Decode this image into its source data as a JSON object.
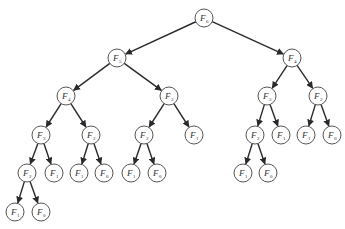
{
  "diagram": {
    "node_radius": 9,
    "colors": {
      "edge": "#2a2a2a",
      "node_stroke": "#555555",
      "text": "#333333"
    },
    "nodes": [
      {
        "id": "n0",
        "label": "F",
        "sub": "6",
        "x": 204,
        "y": 18
      },
      {
        "id": "n1",
        "label": "F",
        "sub": "5",
        "x": 117,
        "y": 58
      },
      {
        "id": "n2",
        "label": "F",
        "sub": "4",
        "x": 292,
        "y": 58
      },
      {
        "id": "n3",
        "label": "F",
        "sub": "4",
        "x": 66,
        "y": 96
      },
      {
        "id": "n4",
        "label": "F",
        "sub": "3",
        "x": 169,
        "y": 96
      },
      {
        "id": "n5",
        "label": "F",
        "sub": "3",
        "x": 267,
        "y": 96
      },
      {
        "id": "n6",
        "label": "F",
        "sub": "2",
        "x": 318,
        "y": 96
      },
      {
        "id": "n7",
        "label": "F",
        "sub": "3",
        "x": 41,
        "y": 135
      },
      {
        "id": "n8",
        "label": "F",
        "sub": "2",
        "x": 91,
        "y": 135
      },
      {
        "id": "n9",
        "label": "F",
        "sub": "2",
        "x": 144,
        "y": 135
      },
      {
        "id": "n10",
        "label": "F",
        "sub": "1",
        "x": 194,
        "y": 135
      },
      {
        "id": "n11",
        "label": "F",
        "sub": "2",
        "x": 255,
        "y": 135
      },
      {
        "id": "n12",
        "label": "F",
        "sub": "1",
        "x": 281,
        "y": 135
      },
      {
        "id": "n13",
        "label": "F",
        "sub": "1",
        "x": 306,
        "y": 135
      },
      {
        "id": "n14",
        "label": "F",
        "sub": "0",
        "x": 332,
        "y": 135
      },
      {
        "id": "n15",
        "label": "F",
        "sub": "2",
        "x": 27,
        "y": 173
      },
      {
        "id": "n16",
        "label": "F",
        "sub": "1",
        "x": 54,
        "y": 173
      },
      {
        "id": "n17",
        "label": "F",
        "sub": "1",
        "x": 79,
        "y": 173
      },
      {
        "id": "n18",
        "label": "F",
        "sub": "0",
        "x": 104,
        "y": 173
      },
      {
        "id": "n19",
        "label": "F",
        "sub": "1",
        "x": 131,
        "y": 173
      },
      {
        "id": "n20",
        "label": "F",
        "sub": "0",
        "x": 157,
        "y": 173
      },
      {
        "id": "n21",
        "label": "F",
        "sub": "1",
        "x": 243,
        "y": 173
      },
      {
        "id": "n22",
        "label": "F",
        "sub": "0",
        "x": 268,
        "y": 173
      },
      {
        "id": "n23",
        "label": "F",
        "sub": "1",
        "x": 15,
        "y": 212
      },
      {
        "id": "n24",
        "label": "F",
        "sub": "0",
        "x": 41,
        "y": 212
      }
    ],
    "edges": [
      [
        "n0",
        "n1"
      ],
      [
        "n0",
        "n2"
      ],
      [
        "n1",
        "n3"
      ],
      [
        "n1",
        "n4"
      ],
      [
        "n2",
        "n5"
      ],
      [
        "n2",
        "n6"
      ],
      [
        "n3",
        "n7"
      ],
      [
        "n3",
        "n8"
      ],
      [
        "n4",
        "n9"
      ],
      [
        "n4",
        "n10"
      ],
      [
        "n5",
        "n11"
      ],
      [
        "n5",
        "n12"
      ],
      [
        "n6",
        "n13"
      ],
      [
        "n6",
        "n14"
      ],
      [
        "n7",
        "n15"
      ],
      [
        "n7",
        "n16"
      ],
      [
        "n8",
        "n17"
      ],
      [
        "n8",
        "n18"
      ],
      [
        "n9",
        "n19"
      ],
      [
        "n9",
        "n20"
      ],
      [
        "n11",
        "n21"
      ],
      [
        "n11",
        "n22"
      ],
      [
        "n15",
        "n23"
      ],
      [
        "n15",
        "n24"
      ]
    ]
  }
}
